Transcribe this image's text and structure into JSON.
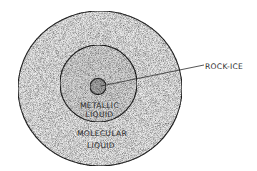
{
  "diagram": {
    "type": "concentric-layers",
    "layers": [
      {
        "name": "outer",
        "label_lines": [
          "MOLECULAR",
          "LIQUID"
        ]
      },
      {
        "name": "middle",
        "label_lines": [
          "METALLIC",
          "LIQUID"
        ]
      },
      {
        "name": "core",
        "label": "ROCK-ICE"
      }
    ]
  },
  "colors": {
    "background": "#ffffff",
    "outline": "#2b2b2b",
    "outer_fill": "#e9e9e9",
    "middle_fill": "#dadada",
    "core_fill": "#a9a9a9"
  }
}
